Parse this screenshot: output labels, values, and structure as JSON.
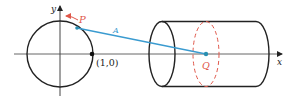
{
  "diagram": {
    "labels": {
      "y_axis": "y",
      "x_axis": "x",
      "point_p": "P",
      "point_unit": "(1,0)",
      "segment": "A",
      "point_q": "Q"
    },
    "colors": {
      "stroke": "#222222",
      "axis": "#555555",
      "segment": "#3a9bd0",
      "accent_red": "#e0574a",
      "point_blue": "#2a8fb0"
    }
  }
}
